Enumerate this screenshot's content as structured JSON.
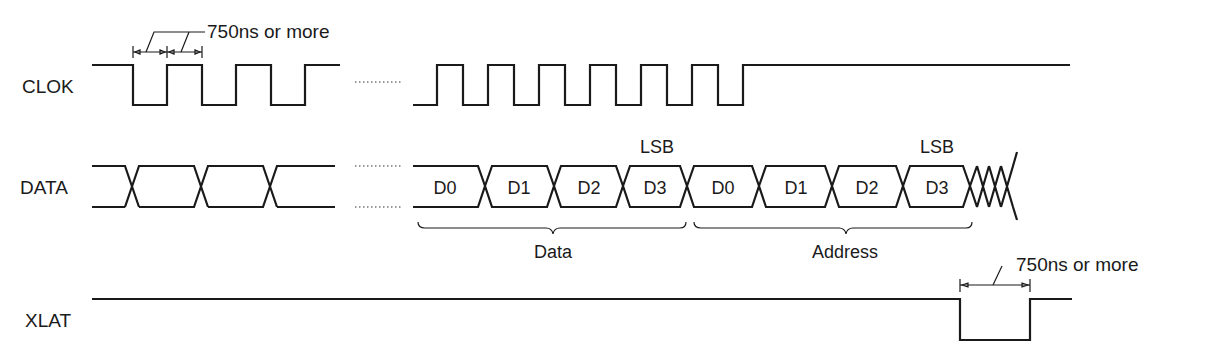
{
  "diagram": {
    "type": "timing-diagram",
    "signals": [
      {
        "name": "CLOK",
        "label": "CLOK"
      },
      {
        "name": "DATA",
        "label": "DATA"
      },
      {
        "name": "XLAT",
        "label": "XLAT"
      }
    ],
    "data_cells": [
      "D0",
      "D1",
      "D2",
      "D3",
      "D0",
      "D1",
      "D2",
      "D3"
    ],
    "lsb_labels": [
      "LSB",
      "LSB"
    ],
    "groups": [
      {
        "label": "Data"
      },
      {
        "label": "Address"
      }
    ],
    "annotations": {
      "clock_timing": "750ns or more",
      "latch_timing": "750ns or more"
    },
    "line_color": "#1a1a1a",
    "background": "#ffffff"
  }
}
